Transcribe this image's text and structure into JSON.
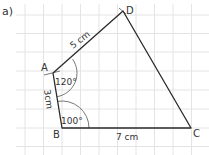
{
  "part_label": "a)",
  "vertices": {
    "A": {
      "label": "A",
      "x": 53,
      "y": 73
    },
    "B": {
      "label": "B",
      "x": 62,
      "y": 128
    },
    "C": {
      "label": "C",
      "x": 191,
      "y": 128
    },
    "D": {
      "label": "D",
      "x": 123,
      "y": 11
    }
  },
  "sides": {
    "AD": "5 cm",
    "AB": "3cm",
    "BC": "7 cm"
  },
  "angles": {
    "A": "120°",
    "B": "100°"
  },
  "colors": {
    "grid": "#e4e4e4",
    "line": "#2a2a2a",
    "arc": "#555555",
    "text": "#333333"
  }
}
